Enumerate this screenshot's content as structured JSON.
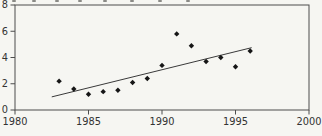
{
  "chart_data": {
    "type": "scatter",
    "title": "",
    "xlabel": "",
    "ylabel": "",
    "xlim": [
      1980,
      2000
    ],
    "ylim": [
      0,
      8
    ],
    "x_ticks": [
      1980,
      1985,
      1990,
      1995,
      2000
    ],
    "y_ticks": [
      0,
      2,
      4,
      6,
      8
    ],
    "x_tick_labels": [
      "1980",
      "1985",
      "1990",
      "1995",
      "2000"
    ],
    "y_tick_labels": [
      "0",
      "2",
      "4",
      "6",
      "8"
    ],
    "grid": false,
    "legend": false,
    "frame": "full-box",
    "marker": "diamond",
    "series": [
      {
        "name": "observations",
        "points": [
          {
            "x": 1983,
            "y": 2.2
          },
          {
            "x": 1984,
            "y": 1.6
          },
          {
            "x": 1985,
            "y": 1.2
          },
          {
            "x": 1986,
            "y": 1.4
          },
          {
            "x": 1987,
            "y": 1.5
          },
          {
            "x": 1988,
            "y": 2.1
          },
          {
            "x": 1989,
            "y": 2.4
          },
          {
            "x": 1990,
            "y": 3.4
          },
          {
            "x": 1991,
            "y": 5.8
          },
          {
            "x": 1992,
            "y": 4.9
          },
          {
            "x": 1993,
            "y": 3.7
          },
          {
            "x": 1994,
            "y": 4.0
          },
          {
            "x": 1995,
            "y": 3.3
          },
          {
            "x": 1996,
            "y": 4.5
          }
        ]
      }
    ],
    "trend_line": {
      "x1": 1982.5,
      "y1": 1.0,
      "x2": 1996.1,
      "y2": 4.75
    },
    "colors": {
      "marker": "#161616",
      "trend": "#3a3a3a",
      "frame": "#4d4d4d",
      "tick": "#4d4d4d",
      "label": "#333333",
      "background": "#f6f6f2"
    }
  },
  "clipped_title_fragments": {
    "x_positions": [
      12,
      32,
      55,
      78,
      103,
      130,
      158,
      186
    ]
  }
}
